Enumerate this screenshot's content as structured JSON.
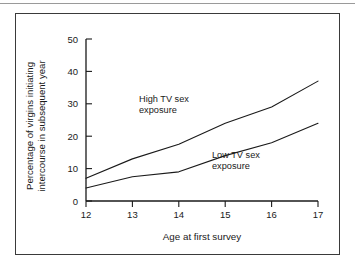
{
  "figure": {
    "background": "#ffffff",
    "line_color": "#1a1a1a",
    "frame_color": "#3a3a3a",
    "rule_color": "#9a9a9a"
  },
  "axis": {
    "y_title_line1": "Percentage of virgins initiating",
    "y_title_line2": "intercourse in subsequent year",
    "x_title": "Age at first survey",
    "y_ticks": [
      "0",
      "10",
      "20",
      "30",
      "40",
      "50"
    ],
    "x_ticks": [
      "12",
      "13",
      "14",
      "15",
      "16",
      "17"
    ]
  },
  "annotations": {
    "high_line1": "High TV sex",
    "high_line2": "exposure",
    "low_line1": "Low TV sex",
    "low_line2": "exposure"
  },
  "chart_data": {
    "type": "line",
    "title": "",
    "xlabel": "Age at first survey",
    "ylabel": "Percentage of virgins initiating intercourse in subsequent year",
    "x": [
      12,
      13,
      14,
      15,
      16,
      17
    ],
    "xlim": [
      12,
      17
    ],
    "ylim": [
      0,
      50
    ],
    "yticks": [
      0,
      10,
      20,
      30,
      40,
      50
    ],
    "xticks": [
      12,
      13,
      14,
      15,
      16,
      17
    ],
    "grid": false,
    "legend": "inline-annotations",
    "series": [
      {
        "name": "High TV sex exposure",
        "values": [
          7,
          13,
          17.5,
          24,
          29,
          37
        ],
        "color": "#1a1a1a"
      },
      {
        "name": "Low TV sex exposure",
        "values": [
          4,
          7.5,
          9,
          14,
          18,
          24
        ],
        "color": "#1a1a1a"
      }
    ]
  }
}
